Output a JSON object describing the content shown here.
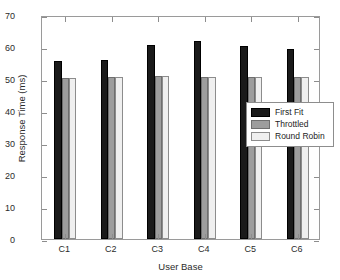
{
  "chart_data": {
    "type": "bar",
    "title": "",
    "xlabel": "User Base",
    "ylabel": "Response Time (ms)",
    "categories": [
      "C1",
      "C2",
      "C3",
      "C4",
      "C5",
      "C6"
    ],
    "series": [
      {
        "name": "First Fit",
        "color": "#1a1a1a",
        "values": [
          55.7,
          55.9,
          60.6,
          61.8,
          60.2,
          59.5
        ]
      },
      {
        "name": "Throttled",
        "color": "#9d9d9d",
        "values": [
          50.4,
          50.6,
          50.8,
          50.7,
          50.6,
          50.7
        ]
      },
      {
        "name": "Round Robin",
        "color": "#efefef",
        "values": [
          50.4,
          50.6,
          50.8,
          50.7,
          50.7,
          50.7
        ]
      }
    ],
    "ylim": [
      0,
      70
    ],
    "yticks": [
      0,
      10,
      20,
      30,
      40,
      50,
      60,
      70
    ],
    "ytick_labels": [
      "0",
      "10",
      "20",
      "30",
      "40",
      "50",
      "60",
      "70"
    ],
    "grid": false,
    "legend_position": "center-right"
  },
  "legend": {
    "entries": [
      {
        "label": "First Fit"
      },
      {
        "label": "Throttled"
      },
      {
        "label": "Round Robin"
      }
    ]
  }
}
